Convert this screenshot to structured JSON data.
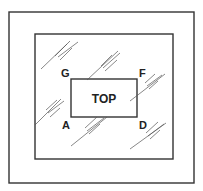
{
  "diagram": {
    "center_label": "TOP",
    "corner_labels": {
      "top_left": "G",
      "top_right": "F",
      "bottom_left": "A",
      "bottom_right": "D"
    },
    "elements": [
      {
        "name": "outer-frame",
        "type": "rectangle"
      },
      {
        "name": "inner-frame",
        "type": "rectangle"
      },
      {
        "name": "top-face",
        "type": "rectangle",
        "label": "TOP"
      },
      {
        "name": "glass-reflection-hatches",
        "type": "diagonal-lines"
      }
    ]
  }
}
